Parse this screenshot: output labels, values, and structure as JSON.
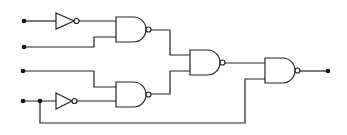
{
  "diagram": {
    "type": "logic-circuit",
    "colors": {
      "line": "#222222",
      "background": "#ffffff"
    },
    "inputs": [
      {
        "id": "in1",
        "x": 24,
        "y": 21
      },
      {
        "id": "in2",
        "x": 24,
        "y": 47
      },
      {
        "id": "in3",
        "x": 23,
        "y": 71
      },
      {
        "id": "in4",
        "x": 23,
        "y": 101
      }
    ],
    "junctions": [
      {
        "id": "j1",
        "x": 40,
        "y": 101
      }
    ],
    "outputs": [
      {
        "id": "out",
        "x": 328,
        "y": 71
      }
    ],
    "gates": [
      {
        "id": "not1",
        "type": "NOT",
        "x": 56,
        "y": 13,
        "w": 18,
        "h": 16
      },
      {
        "id": "not2",
        "type": "NOT",
        "x": 56,
        "y": 93,
        "w": 16,
        "h": 16
      },
      {
        "id": "nand1",
        "type": "NAND",
        "x": 116,
        "y": 17,
        "w": 30,
        "h": 25
      },
      {
        "id": "nand2",
        "type": "NAND",
        "x": 116,
        "y": 82,
        "w": 30,
        "h": 25
      },
      {
        "id": "nand3",
        "type": "NAND",
        "x": 190,
        "y": 50,
        "w": 30,
        "h": 25
      },
      {
        "id": "nand4",
        "type": "NAND",
        "x": 265,
        "y": 58,
        "w": 30,
        "h": 25
      }
    ],
    "wires": [
      "M24,21 L56,21",
      "M79,21 L116,21",
      "M24,47 L94,47 L94,37 L116,37",
      "M23,71 L94,71 L94,87 L116,87",
      "M23,101 L56,101",
      "M75,101 L116,101",
      "M151,30 L170,30 L170,55 L190,55",
      "M151,94 L170,94 L170,71 L190,71",
      "M225,63 L265,63",
      "M40,101 L40,123 L245,123 L245,79 L265,79",
      "M300,71 L328,71"
    ]
  }
}
